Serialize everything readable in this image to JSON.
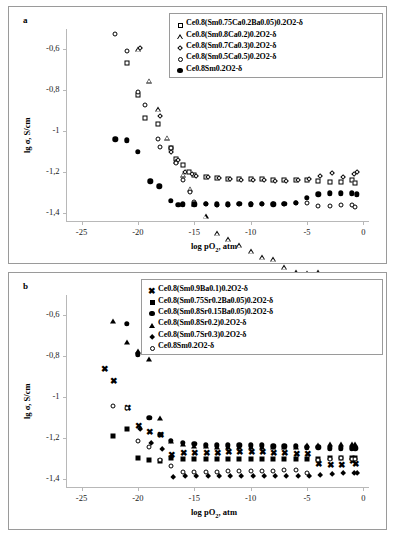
{
  "figure": {
    "background": "#ffffff",
    "frame_color": "#9a9a9a",
    "axis_color": "#b8b8b8",
    "marker_color": "#000000"
  },
  "panels": [
    {
      "id": "a",
      "label": "a",
      "legend_position": "top-right",
      "chart_data": {
        "type": "scatter",
        "title": "",
        "xlabel": "log pO2, atm",
        "xlabel_display": "log pO₂, atm",
        "ylabel": "lg σ, S/cm",
        "xlim": [
          -27,
          0.5
        ],
        "ylim": [
          -1.44,
          -0.5
        ],
        "xticks": [
          -25,
          -20,
          -15,
          -10,
          -5,
          0
        ],
        "xtick_labels": [
          "-25",
          "-20",
          "-15",
          "-10",
          "-5",
          "0"
        ],
        "yticks": [
          -0.6,
          -0.8,
          -1.0,
          -1.2,
          -1.4
        ],
        "ytick_labels": [
          "-0,6",
          "-0,8",
          "-1",
          "-1,2",
          "-1,4"
        ],
        "grid": false,
        "legend_position": "upper right",
        "series": [
          {
            "name": "Ce0.8(Sm0.75Ca0.2Ba0.05)0.2O2-δ",
            "marker": "open-square",
            "x": [
              -21,
              -20,
              -19.4,
              -18.2,
              -17.1,
              -16.6,
              -16,
              -15.5,
              -15,
              -14,
              -13,
              -12,
              -11,
              -10,
              -9,
              -8,
              -7,
              -6,
              -5,
              -4,
              -3,
              -2,
              -1,
              -0.7
            ],
            "y": [
              -0.665,
              -0.825,
              -0.935,
              -0.965,
              -1.085,
              -1.135,
              -1.165,
              -1.2,
              -1.215,
              -1.225,
              -1.23,
              -1.232,
              -1.235,
              -1.235,
              -1.235,
              -1.238,
              -1.238,
              -1.24,
              -1.24,
              -1.245,
              -1.248,
              -1.25,
              -1.238,
              -1.252
            ]
          },
          {
            "name": "Ce0.8(Sm0.8Ca0.2)0.2O2-δ",
            "marker": "open-triangle",
            "x": [
              -20,
              -19,
              -18.2,
              -17.4,
              -16.6,
              -16,
              -15.4,
              -15,
              -14,
              -13,
              -12,
              -11,
              -10,
              -9,
              -8,
              -7,
              -6,
              -5,
              -4,
              -3,
              -2,
              -1,
              -0.6
            ],
            "y": [
              -0.6,
              -0.73,
              -0.845,
              -0.96,
              -1.05,
              -1.09,
              -1.135,
              -1.185,
              -1.22,
              -1.28,
              -1.285,
              -1.29,
              -1.295,
              -1.3,
              -1.285,
              -1.3,
              -1.3,
              -1.28,
              -1.25,
              -1.25,
              -1.25,
              -1.245,
              -1.245
            ]
          },
          {
            "name": "Ce0.8(Sm0.7Ca0.3)0.2O2-δ",
            "marker": "open-diamond",
            "x": [
              -20,
              -18.2,
              -17.2,
              -16.6,
              -16,
              -15.4,
              -15,
              -14,
              -13,
              -12,
              -11,
              -10,
              -9,
              -8,
              -7,
              -6,
              -5,
              -4,
              -3,
              -2,
              -1,
              -0.7
            ],
            "y": [
              -0.585,
              -0.915,
              -1.09,
              -1.13,
              -1.19,
              -1.2,
              -1.21,
              -1.215,
              -1.222,
              -1.225,
              -1.23,
              -1.228,
              -1.228,
              -1.232,
              -1.232,
              -1.228,
              -1.225,
              -1.21,
              -1.195,
              -1.215,
              -1.2,
              -1.19
            ]
          },
          {
            "name": "Ce0.8(Sm0.5Ca0.5)0.2O2-δ",
            "marker": "open-circle",
            "x": [
              -22,
              -21,
              -20,
              -19.4,
              -18.2,
              -18,
              -17.1,
              -16.6,
              -16,
              -15.4,
              -15,
              -14,
              -13,
              -12,
              -11,
              -10,
              -9,
              -8,
              -7,
              -6,
              -5,
              -4,
              -3,
              -2,
              -1,
              -0.7
            ],
            "y": [
              -0.525,
              -0.61,
              -0.81,
              -0.87,
              -1.04,
              -1.08,
              -1.085,
              -1.155,
              -1.24,
              -1.3,
              -1.345,
              -1.355,
              -1.36,
              -1.36,
              -1.358,
              -1.358,
              -1.358,
              -1.355,
              -1.355,
              -1.352,
              -1.35,
              -1.365,
              -1.365,
              -1.362,
              -1.36,
              -1.37
            ]
          },
          {
            "name": "Ce0.8Sm0.2O2-δ",
            "marker": "filled-circle",
            "x": [
              -22,
              -21,
              -20,
              -18.9,
              -18.1,
              -17.1,
              -16.4,
              -16,
              -15,
              -14,
              -13,
              -12,
              -11,
              -10,
              -9,
              -8,
              -7,
              -6,
              -5,
              -4,
              -3,
              -2,
              -1,
              -0.6
            ],
            "y": [
              -1.04,
              -1.045,
              -1.1,
              -1.245,
              -1.27,
              -1.34,
              -1.36,
              -1.358,
              -1.358,
              -1.355,
              -1.358,
              -1.358,
              -1.355,
              -1.358,
              -1.355,
              -1.358,
              -1.355,
              -1.35,
              -1.325,
              -1.31,
              -1.305,
              -1.305,
              -1.305,
              -1.31
            ]
          }
        ]
      }
    },
    {
      "id": "b",
      "label": "b",
      "legend_position": "top-right",
      "chart_data": {
        "type": "scatter",
        "title": "",
        "xlabel": "log pO2, atm",
        "xlabel_display": "log pO₂, atm",
        "ylabel": "lg σ, S/cm",
        "xlim": [
          -27,
          0.5
        ],
        "ylim": [
          -1.44,
          -0.5
        ],
        "xticks": [
          -25,
          -20,
          -15,
          -10,
          -5,
          0
        ],
        "xtick_labels": [
          "-25",
          "-20",
          "-15",
          "-10",
          "-5",
          "0"
        ],
        "yticks": [
          -0.6,
          -0.8,
          -1.0,
          -1.2,
          -1.4
        ],
        "ytick_labels": [
          "-0,6",
          "-0,8",
          "-1",
          "-1,2",
          "-1,4"
        ],
        "grid": false,
        "legend_position": "upper right",
        "series": [
          {
            "name": "Ce0.8(Sm0.9Ba0.1)0.2O2-δ",
            "marker": "x-cross",
            "x": [
              -23,
              -22.2,
              -21,
              -20,
              -19,
              -18,
              -17.1,
              -16,
              -15,
              -14,
              -13,
              -12,
              -11,
              -10,
              -9,
              -8,
              -7,
              -6,
              -5,
              -4,
              -3,
              -2,
              -1,
              -0.7
            ],
            "y": [
              -0.865,
              -0.925,
              -1.06,
              -1.145,
              -1.175,
              -1.19,
              -1.29,
              -1.28,
              -1.28,
              -1.28,
              -1.28,
              -1.275,
              -1.275,
              -1.275,
              -1.275,
              -1.278,
              -1.278,
              -1.285,
              -1.285,
              -1.33,
              -1.335,
              -1.335,
              -1.32,
              -1.33
            ]
          },
          {
            "name": "Ce0.8(Sm0.75Sr0.2Ba0.05)0.2O2-δ",
            "marker": "filled-square",
            "x": [
              -22.2,
              -21,
              -20,
              -19,
              -18,
              -17.1,
              -16,
              -15,
              -14,
              -13,
              -12,
              -11,
              -10,
              -9,
              -8,
              -7,
              -6,
              -5,
              -4,
              -3,
              -2,
              -1,
              -0.7
            ],
            "y": [
              -1.19,
              -1.155,
              -1.3,
              -1.31,
              -1.315,
              -1.3,
              -1.305,
              -1.305,
              -1.305,
              -1.305,
              -1.305,
              -1.305,
              -1.305,
              -1.305,
              -1.305,
              -1.305,
              -1.305,
              -1.305,
              -1.305,
              -1.3,
              -1.3,
              -1.3,
              -1.3
            ]
          },
          {
            "name": "Ce0.8(Sm0.8Sr0.15Ba0.05)0.2O2-δ",
            "marker": "filled-circle",
            "x": [
              -21,
              -20,
              -19,
              -18,
              -17.1,
              -16,
              -15,
              -14,
              -13,
              -12,
              -11,
              -10,
              -9,
              -8,
              -7,
              -6,
              -5,
              -4,
              -3,
              -2,
              -1,
              -0.7
            ],
            "y": [
              -0.64,
              -0.79,
              -1.1,
              -1.185,
              -1.215,
              -1.225,
              -1.23,
              -1.235,
              -1.235,
              -1.235,
              -1.235,
              -1.235,
              -1.235,
              -1.24,
              -1.24,
              -1.24,
              -1.245,
              -1.245,
              -1.25,
              -1.25,
              -1.25,
              -1.25
            ]
          },
          {
            "name": "Ce0.8(Sm0.8Sr0.2)0.2O2-δ",
            "marker": "filled-triangle",
            "x": [
              -22.2,
              -21,
              -20,
              -19,
              -18,
              -17.1,
              -16,
              -15,
              -14,
              -13,
              -12,
              -11,
              -10,
              -9,
              -8,
              -7,
              -6,
              -5,
              -4,
              -3,
              -2,
              -1,
              -0.7
            ],
            "y": [
              -0.625,
              -0.73,
              -0.775,
              -0.815,
              -1.1,
              -1.215,
              -1.23,
              -1.24,
              -1.24,
              -1.245,
              -1.245,
              -1.245,
              -1.245,
              -1.245,
              -1.245,
              -1.245,
              -1.245,
              -1.235,
              -1.235,
              -1.23,
              -1.23,
              -1.23,
              -1.23
            ]
          },
          {
            "name": "Ce0.8(Sm0.7Sr0.3)0.2O2-δ",
            "marker": "filled-diamond",
            "x": [
              -20,
              -19,
              -18,
              -17.1,
              -16,
              -15,
              -14,
              -13,
              -12,
              -11,
              -10,
              -9,
              -8,
              -7,
              -6,
              -5,
              -4,
              -3,
              -2,
              -1,
              -0.7
            ],
            "y": [
              -1.145,
              -1.215,
              -1.245,
              -1.38,
              -1.375,
              -1.375,
              -1.375,
              -1.375,
              -1.375,
              -1.375,
              -1.375,
              -1.375,
              -1.375,
              -1.375,
              -1.375,
              -1.375,
              -1.37,
              -1.365,
              -1.36,
              -1.36,
              -1.36
            ]
          },
          {
            "name": "Ce0.8Sm0.2O2-δ",
            "marker": "open-circle",
            "x": [
              -22.2,
              -21,
              -20,
              -19,
              -18,
              -17.1,
              -16,
              -15,
              -14,
              -13,
              -12,
              -11,
              -10,
              -9,
              -8,
              -7,
              -6,
              -5,
              -4,
              -3,
              -2,
              -1,
              -0.7
            ],
            "y": [
              -1.045,
              -1.055,
              -1.215,
              -1.245,
              -1.31,
              -1.335,
              -1.365,
              -1.365,
              -1.365,
              -1.365,
              -1.36,
              -1.36,
              -1.36,
              -1.36,
              -1.36,
              -1.355,
              -1.355,
              -1.37,
              -1.31,
              -1.305,
              -1.3,
              -1.305,
              -1.305
            ]
          }
        ]
      }
    }
  ]
}
